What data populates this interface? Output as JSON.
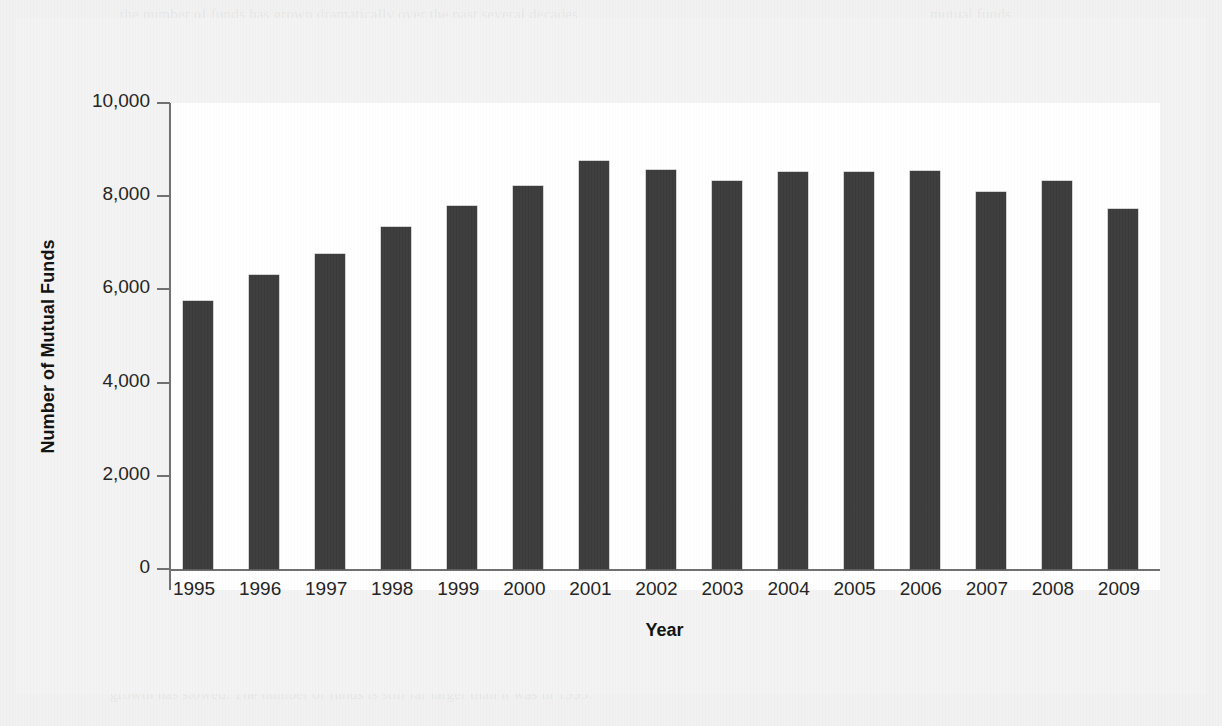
{
  "figure": {
    "background_color": "#f3f3f3",
    "bar_color": "#3b3b3b",
    "axis_color": "#6f6f6f"
  },
  "chart_data": {
    "type": "bar",
    "title": "",
    "xlabel": "Year",
    "ylabel": "Number of Mutual Funds",
    "categories": [
      "1995",
      "1996",
      "1997",
      "1998",
      "1999",
      "2000",
      "2001",
      "2002",
      "2003",
      "2004",
      "2005",
      "2006",
      "2007",
      "2008",
      "2009"
    ],
    "values": [
      5760,
      6320,
      6750,
      7350,
      7800,
      8220,
      8760,
      8560,
      8330,
      8510,
      8530,
      8550,
      8100,
      8320,
      7730
    ],
    "ylim": [
      0,
      10000
    ],
    "ytick_values": [
      0,
      2000,
      4000,
      6000,
      8000,
      10000
    ],
    "ytick_labels": [
      "0",
      "2,000",
      "4,000",
      "6,000",
      "8,000",
      "10,000"
    ],
    "grid": false,
    "legend": false
  },
  "page_ghost_text": [
    {
      "text": "the number of funds has grown dramatically over the past several decades.",
      "x": 120,
      "y": 6,
      "size": 15
    },
    {
      "text": "mutual funds",
      "x": 930,
      "y": 6,
      "size": 15
    },
    {
      "text": "for the year, and the number of mutual funds available to investors as",
      "x": 250,
      "y": 62,
      "size": 15
    },
    {
      "text": "as",
      "x": 1160,
      "y": 62,
      "size": 15
    },
    {
      "text": "the",
      "x": 20,
      "y": 118,
      "size": 13
    },
    {
      "text": "trend",
      "x": 20,
      "y": 150,
      "size": 13
    },
    {
      "text": "funds",
      "x": 20,
      "y": 182,
      "size": 13
    },
    {
      "text": "that",
      "x": 20,
      "y": 214,
      "size": 13
    },
    {
      "text": "grew",
      "x": 20,
      "y": 246,
      "size": 13
    },
    {
      "text": "from",
      "x": 20,
      "y": 278,
      "size": 13
    },
    {
      "text": "a low",
      "x": 20,
      "y": 310,
      "size": 13
    },
    {
      "text": "base",
      "x": 20,
      "y": 342,
      "size": 13
    },
    {
      "text": "before",
      "x": 20,
      "y": 374,
      "size": 13
    },
    {
      "text": "the",
      "x": 20,
      "y": 406,
      "size": 13
    },
    {
      "text": "market",
      "x": 20,
      "y": 438,
      "size": 13
    },
    {
      "text": "peak",
      "x": 20,
      "y": 470,
      "size": 13
    },
    {
      "text": "MUT",
      "x": 1155,
      "y": 430,
      "size": 15
    },
    {
      "text": "the investor",
      "x": 1120,
      "y": 560,
      "size": 13
    },
    {
      "text": "however",
      "x": 20,
      "y": 600,
      "size": 13
    },
    {
      "text": "some of these funds have been liquidated or merged into other funds, so the net",
      "x": 110,
      "y": 652,
      "size": 15
    },
    {
      "text": "growth has slowed. The number of funds is still far larger than it was in 1995.",
      "x": 110,
      "y": 686,
      "size": 15
    }
  ]
}
